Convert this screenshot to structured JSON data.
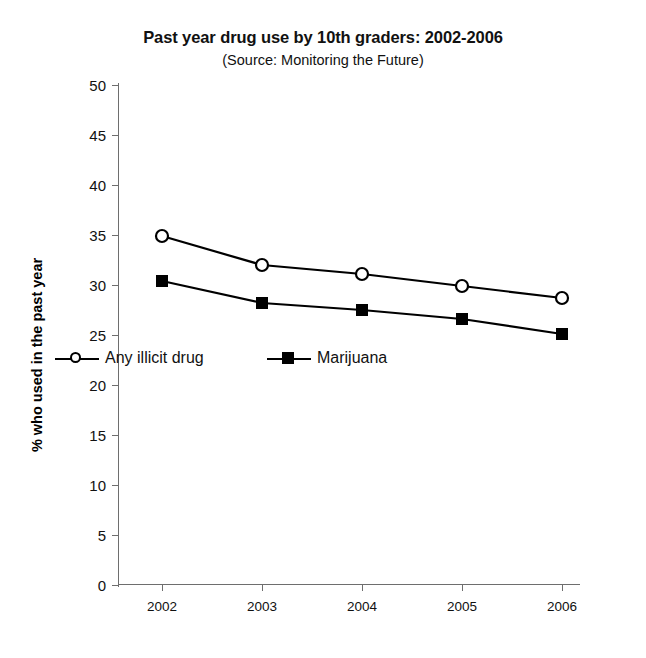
{
  "chart_data": {
    "type": "line",
    "title": "Past year drug use by 10th graders: 2002-2006",
    "subtitle": "(Source: Monitoring the Future)",
    "xlabel": "",
    "ylabel": "% who used in the past year",
    "categories": [
      "2002",
      "2003",
      "2004",
      "2005",
      "2006"
    ],
    "series": [
      {
        "name": "Any illicit drug",
        "marker": "open-circle",
        "color": "#000000",
        "values": [
          34.9,
          32.0,
          31.1,
          29.9,
          28.7
        ]
      },
      {
        "name": "Marijuana",
        "marker": "filled-square",
        "color": "#000000",
        "values": [
          30.4,
          28.2,
          27.5,
          26.6,
          25.1
        ]
      }
    ],
    "ylim": [
      0,
      50
    ],
    "yticks": [
      0,
      5,
      10,
      15,
      20,
      25,
      30,
      35,
      40,
      45,
      50
    ],
    "ytick_labels": [
      "0",
      "5",
      "10",
      "15",
      "20",
      "25",
      "30",
      "35",
      "40",
      "45",
      "50"
    ],
    "grid": false,
    "legend_position": "inside-lower-left"
  }
}
